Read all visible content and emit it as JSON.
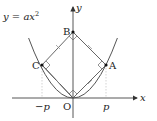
{
  "diagram": {
    "curve_label": "y = ax",
    "curve_exp": "2",
    "axes": {
      "x_label": "x",
      "y_label": "y"
    },
    "points": {
      "origin": "O",
      "A": "A",
      "B": "B",
      "C": "C"
    },
    "ticks": {
      "neg_p": "−p",
      "pos_p": "p"
    },
    "colors": {
      "line": "#555555",
      "text": "#222222",
      "dashed": "#bbbbbb"
    }
  }
}
